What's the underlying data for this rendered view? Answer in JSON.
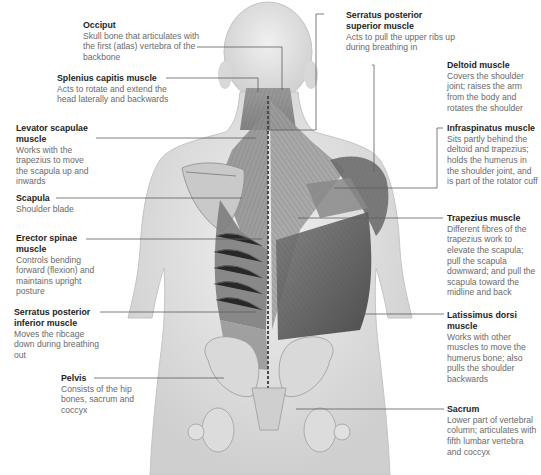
{
  "diagram": {
    "labels": [
      {
        "id": "occiput",
        "title": "Occiput",
        "desc": "Skull bone that articulates with the first (atlas) vertebra of the backbone"
      },
      {
        "id": "splenius",
        "title": "Splenius capitis muscle",
        "desc": "Acts to rotate and extend the head laterally and backwards"
      },
      {
        "id": "levator",
        "title": "Levator scapulae muscle",
        "desc": "Works with the trapezius to move the scapula up and inwards"
      },
      {
        "id": "scapula",
        "title": "Scapula",
        "desc": "Shoulder blade"
      },
      {
        "id": "erector",
        "title": "Erector spinae muscle",
        "desc": "Controls bending forward (flexion) and maintains upright posture"
      },
      {
        "id": "serratus-inf",
        "title": "Serratus posterior inferior muscle",
        "desc": "Moves the ribcage down during breathing out"
      },
      {
        "id": "pelvis",
        "title": "Pelvis",
        "desc": "Consists of the hip bones, sacrum and coccyx"
      },
      {
        "id": "serratus-sup",
        "title": "Serratus posterior superior muscle",
        "desc": "Acts to pull the upper ribs up during breathing in"
      },
      {
        "id": "deltoid",
        "title": "Deltoid muscle",
        "desc": "Covers the shoulder joint; raises the arm from the body and rotates the shoulder"
      },
      {
        "id": "infraspinatus",
        "title": "Infraspinatus muscle",
        "desc": "Sits partly behind the deltoid and trapezius; holds the humerus in the shoulder joint, and is part of the rotator cuff"
      },
      {
        "id": "trapezius",
        "title": "Trapezius muscle",
        "desc": "Different fibres of the trapezius work to elevate the scapula; pull the scapula downward; and pull the scapula toward the midline and back"
      },
      {
        "id": "latissimus",
        "title": "Latissimus dorsi muscle",
        "desc": "Works with other muscles to move the humerus bone; also pulls the shoulder backwards"
      },
      {
        "id": "sacrum",
        "title": "Sacrum",
        "desc": "Lower part of vertebral column; articulates with fifth lumbar vertebra and coccyx"
      }
    ]
  },
  "colors": {
    "title_text": "#1e1e1e",
    "desc_text": "#6a6a6a",
    "leader_line": "#5e5e5e",
    "skin": "#e6e6e6",
    "muscle_dark": "#5a5a5a"
  }
}
